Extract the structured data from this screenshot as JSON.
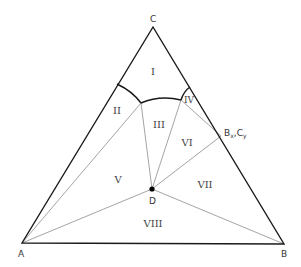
{
  "diagram": {
    "type": "ternary-phase-diagram",
    "vertices": {
      "A": {
        "label": "A",
        "x": 22,
        "y": 243
      },
      "B": {
        "label": "B",
        "x": 284,
        "y": 244
      },
      "C": {
        "label": "C",
        "x": 153,
        "y": 27
      }
    },
    "points": {
      "D": {
        "label": "D",
        "x": 152,
        "y": 189
      },
      "BxCy": {
        "label_main_1": "B",
        "label_sub_1": "x",
        "label_sep": ",",
        "label_main_2": "C",
        "label_sub_2": "y",
        "x": 221,
        "y": 136
      }
    },
    "regions": [
      {
        "id": "I",
        "label": "I",
        "x": 153,
        "y": 75
      },
      {
        "id": "II",
        "label": "II",
        "x": 117,
        "y": 114
      },
      {
        "id": "III",
        "label": "III",
        "x": 159,
        "y": 128
      },
      {
        "id": "IV",
        "label": "IV",
        "x": 189,
        "y": 103
      },
      {
        "id": "V",
        "label": "V",
        "x": 118,
        "y": 183
      },
      {
        "id": "VI",
        "label": "VI",
        "x": 187,
        "y": 146
      },
      {
        "id": "VII",
        "label": "VII",
        "x": 205,
        "y": 188
      },
      {
        "id": "VIII",
        "label": "VIII",
        "x": 153,
        "y": 227
      }
    ]
  }
}
